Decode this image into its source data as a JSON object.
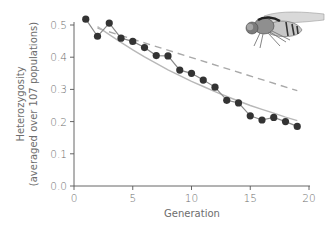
{
  "chart_data": {
    "type": "line",
    "title": "",
    "xlabel": "Generation",
    "ylabel": "Heterozygosity",
    "ylabel_line2": "(averaged over 107 populations)",
    "xlim": [
      0,
      20
    ],
    "ylim": [
      0.0,
      0.5
    ],
    "x_ticks": [
      0,
      5,
      10,
      15,
      20
    ],
    "x_tick_labels": [
      "0",
      "5",
      "10",
      "15",
      "20"
    ],
    "y_ticks": [
      0.0,
      0.1,
      0.2,
      0.3,
      0.4,
      0.5
    ],
    "y_tick_labels": [
      "0.0",
      "0.1",
      "0.2",
      "0.3",
      "0.4",
      "0.5"
    ],
    "grid": false,
    "legend": null,
    "series": [
      {
        "name": "Observed",
        "style": "line-with-markers",
        "color": "#333333",
        "line_color": "#8a8a8a",
        "x": [
          1,
          2,
          3,
          4,
          5,
          6,
          7,
          8,
          9,
          10,
          11,
          12,
          13,
          14,
          15,
          16,
          17,
          18,
          19
        ],
        "values": [
          0.518,
          0.465,
          0.506,
          0.459,
          0.449,
          0.43,
          0.405,
          0.404,
          0.36,
          0.35,
          0.329,
          0.307,
          0.266,
          0.258,
          0.218,
          0.205,
          0.213,
          0.2,
          0.185
        ]
      },
      {
        "name": "Expected (census size)",
        "style": "dashed",
        "color": "#a9a9a9",
        "x": [
          2,
          19
        ],
        "values": [
          0.49,
          0.296
        ]
      },
      {
        "name": "Expected (effective size)",
        "style": "solid",
        "color": "#b8b8b8",
        "x": [
          2,
          3,
          4,
          5,
          6,
          7,
          8,
          9,
          10,
          11,
          12,
          13,
          14,
          15,
          16,
          17,
          18,
          19
        ],
        "values": [
          0.495,
          0.47,
          0.446,
          0.423,
          0.401,
          0.381,
          0.361,
          0.343,
          0.325,
          0.309,
          0.293,
          0.278,
          0.264,
          0.25,
          0.238,
          0.226,
          0.214,
          0.203
        ]
      }
    ],
    "annotations": [
      {
        "type": "illustration",
        "label": "fruit-fly",
        "position": "top-right"
      }
    ]
  }
}
